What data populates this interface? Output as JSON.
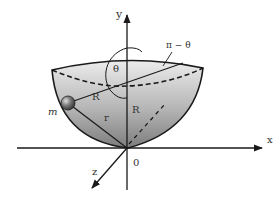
{
  "diagram": {
    "title": "",
    "labels": {
      "y_axis": "y",
      "x_axis": "x",
      "z_axis": "z",
      "origin": "0",
      "mass": "m",
      "radius_slant": "R",
      "radius_vertical": "R",
      "r_vector": "r",
      "theta": "θ",
      "pi_minus_theta": "π − θ"
    },
    "colors": {
      "stroke": "#1a1a1a",
      "bowl_light": "#e6e6e6",
      "bowl_dark": "#8a8a8a",
      "ball": "#555555",
      "background": "#ffffff"
    }
  }
}
